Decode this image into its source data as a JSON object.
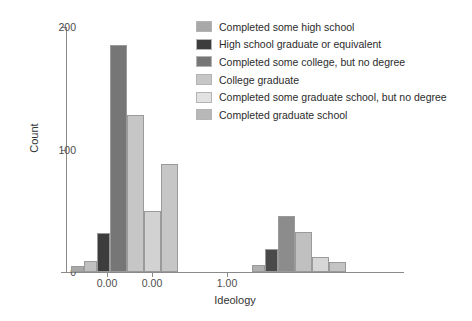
{
  "chart_data": {
    "type": "bar",
    "title": "",
    "xlabel": "Ideology",
    "ylabel": "Count",
    "ylim": [
      0,
      200
    ],
    "yticks": [
      0,
      100,
      200
    ],
    "ytick_labels": [
      "0",
      "100",
      "200"
    ],
    "xtick_labels": [
      "0.00",
      "0.00",
      "1.00"
    ],
    "xtick_positions_px": [
      107,
      152,
      227
    ],
    "grid": false,
    "legend_position": "right",
    "legend_entries": [
      "Completed some high school",
      "High school graduate or equivalent",
      "Completed some college, but no degree",
      "College graduate",
      "Completed some graduate school, but no degree",
      "Completed graduate school"
    ],
    "colors": [
      "#a8a8a8",
      "#3d3d3d",
      "#767676",
      "#c6c6c6",
      "#e2e2e2",
      "#b8b8b8"
    ],
    "bars": [
      {
        "group": "left",
        "series": "Completed some high school",
        "value": 5,
        "x_px": 5,
        "w_px": 13,
        "color": "#a8a8a8"
      },
      {
        "group": "left",
        "series": "High school graduate or equivalent",
        "value": 9,
        "x_px": 18,
        "w_px": 13,
        "color": "#c0c0c0"
      },
      {
        "group": "left",
        "series": "Completed some college, but no degree",
        "value": 32,
        "x_px": 31,
        "w_px": 13,
        "color": "#3d3d3d"
      },
      {
        "group": "left",
        "series": "College graduate",
        "value": 185,
        "x_px": 44,
        "w_px": 17,
        "color": "#767676"
      },
      {
        "group": "left",
        "series": "Completed some graduate school, but no degree",
        "value": 128,
        "x_px": 61,
        "w_px": 17,
        "color": "#c6c6c6"
      },
      {
        "group": "left",
        "series": "Completed graduate school",
        "value": 50,
        "x_px": 78,
        "w_px": 17,
        "color": "#d2d2d2"
      },
      {
        "group": "left",
        "series": "Completed graduate school",
        "value": 88,
        "x_px": 95,
        "w_px": 17,
        "color": "#c6c6c6"
      },
      {
        "group": "right",
        "series": "Completed some high school",
        "value": 6,
        "x_px": 186,
        "w_px": 13,
        "color": "#b0b0b0"
      },
      {
        "group": "right",
        "series": "High school graduate or equivalent",
        "value": 19,
        "x_px": 199,
        "w_px": 13,
        "color": "#4a4a4a"
      },
      {
        "group": "right",
        "series": "Completed some college, but no degree",
        "value": 46,
        "x_px": 212,
        "w_px": 17,
        "color": "#8c8c8c"
      },
      {
        "group": "right",
        "series": "College graduate",
        "value": 33,
        "x_px": 229,
        "w_px": 17,
        "color": "#c0c0c0"
      },
      {
        "group": "right",
        "series": "Completed some graduate school, but no degree",
        "value": 12,
        "x_px": 246,
        "w_px": 17,
        "color": "#d6d6d6"
      },
      {
        "group": "right",
        "series": "Completed graduate school",
        "value": 8,
        "x_px": 263,
        "w_px": 17,
        "color": "#c4c4c4"
      }
    ]
  }
}
